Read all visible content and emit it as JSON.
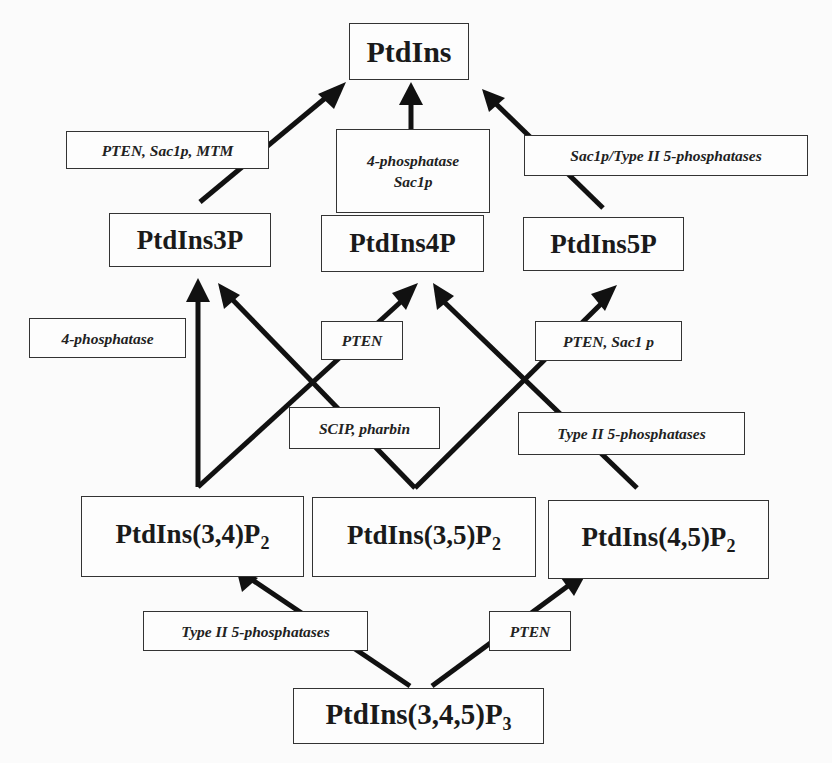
{
  "diagram": {
    "nodes": {
      "ptdins": "PtdIns",
      "ptdins3p": "PtdIns3P",
      "ptdins4p": "PtdIns4P",
      "ptdins5p": "PtdIns5P",
      "ptdins34p2": {
        "base": "PtdIns(3,4)P",
        "sub": "2"
      },
      "ptdins35p2": {
        "base": "PtdIns(3,5)P",
        "sub": "2"
      },
      "ptdins45p2": {
        "base": "PtdIns(4,5)P",
        "sub": "2"
      },
      "ptdins345p3": {
        "base": "PtdIns(3,4,5)P",
        "sub": "3"
      }
    },
    "enzymes": {
      "e3p_to_ptdins": "PTEN, Sac1p, MTM",
      "e4p_to_ptdins_line1": "4-phosphatase",
      "e4p_to_ptdins_line2": "Sac1p",
      "e5p_to_ptdins": "Sac1p/Type II 5-phosphatases",
      "e34_to_3p": "4-phosphatase",
      "e34_to_4p": "PTEN",
      "e35_to_3p": "SCIP, pharbin",
      "e45_to_5p": "PTEN, Sac1 p",
      "e45_to_4p": "Type II 5-phosphatases",
      "e345_to_34": "Type II 5-phosphatases",
      "e345_to_45": "PTEN"
    },
    "edges": [
      {
        "from": "PtdIns3P",
        "to": "PtdIns",
        "label": "PTEN, Sac1p, MTM"
      },
      {
        "from": "PtdIns4P",
        "to": "PtdIns",
        "label": "4-phosphatase Sac1p"
      },
      {
        "from": "PtdIns5P",
        "to": "PtdIns",
        "label": "Sac1p/Type II 5-phosphatases"
      },
      {
        "from": "PtdIns(3,4)P2",
        "to": "PtdIns3P",
        "label": "4-phosphatase"
      },
      {
        "from": "PtdIns(3,4)P2",
        "to": "PtdIns4P",
        "label": "PTEN"
      },
      {
        "from": "PtdIns(3,5)P2",
        "to": "PtdIns3P",
        "label": "SCIP, pharbin"
      },
      {
        "from": "PtdIns(3,5)P2",
        "to": "PtdIns5P",
        "label": "PTEN, Sac1 p"
      },
      {
        "from": "PtdIns(4,5)P2",
        "to": "PtdIns4P",
        "label": "Type II 5-phosphatases"
      },
      {
        "from": "PtdIns(3,4,5)P3",
        "to": "PtdIns(3,4)P2",
        "label": "Type II 5-phosphatases"
      },
      {
        "from": "PtdIns(3,4,5)P3",
        "to": "PtdIns(4,5)P2",
        "label": "PTEN"
      }
    ]
  }
}
